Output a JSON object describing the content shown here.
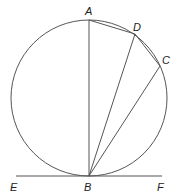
{
  "diagram": {
    "type": "circle-tangent-chords",
    "colors": {
      "stroke": "#555555",
      "label": "#222222",
      "background": "#ffffff"
    },
    "circle": {
      "cx": 89,
      "cy": 98,
      "r": 78
    },
    "points": {
      "A": {
        "x": 89,
        "y": 20,
        "label": "A",
        "lx": 85,
        "ly": 15
      },
      "D": {
        "x": 135,
        "y": 34,
        "label": "D",
        "lx": 133,
        "ly": 31
      },
      "C": {
        "x": 160,
        "y": 66,
        "label": "C",
        "lx": 162,
        "ly": 64
      },
      "B": {
        "x": 89,
        "y": 176,
        "label": "B",
        "lx": 84,
        "ly": 191
      },
      "E": {
        "x": 16,
        "y": 176,
        "label": "E",
        "lx": 10,
        "ly": 191
      },
      "F": {
        "x": 162,
        "y": 176,
        "label": "F",
        "lx": 157,
        "ly": 191
      }
    },
    "segments": [
      {
        "from": "A",
        "to": "B",
        "name": "chord-AB"
      },
      {
        "from": "A",
        "to": "D",
        "name": "chord-AD"
      },
      {
        "from": "D",
        "to": "C",
        "name": "chord-DC"
      },
      {
        "from": "D",
        "to": "B",
        "name": "chord-DB"
      },
      {
        "from": "C",
        "to": "B",
        "name": "chord-CB"
      },
      {
        "from": "E",
        "to": "F",
        "name": "tangent-EF"
      }
    ]
  }
}
